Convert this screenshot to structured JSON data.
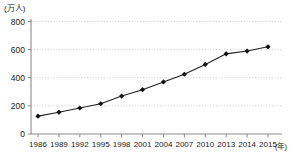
{
  "chart_data": {
    "type": "line",
    "title": "",
    "subtitle": "",
    "xlabel": "(年)",
    "ylabel": "(万人)",
    "ylim": [
      0,
      800
    ],
    "yticks": [
      0,
      200,
      400,
      600,
      800
    ],
    "grid": true,
    "grid_style": "dotted-horizontal",
    "legend": "none",
    "marker": "diamond",
    "line_color": "#222222",
    "marker_color": "#111111",
    "grid_color": "#c8c8c8",
    "axis_color": "#8a8a8a",
    "categories": [
      "1986",
      "1989",
      "1992",
      "1995",
      "1998",
      "2001",
      "2004",
      "2007",
      "2010",
      "2013",
      "2014",
      "2015"
    ],
    "values": [
      127,
      155,
      185,
      215,
      270,
      315,
      370,
      425,
      495,
      570,
      590,
      620
    ],
    "series": [
      {
        "name": "",
        "values": [
          127,
          155,
          185,
          215,
          270,
          315,
          370,
          425,
          495,
          570,
          590,
          620
        ]
      }
    ],
    "ytick_labels": [
      "800",
      "600",
      "400",
      "200",
      "0"
    ],
    "xtick_labels": [
      "1986",
      "1989",
      "1992",
      "1995",
      "1998",
      "2001",
      "2004",
      "2007",
      "2010",
      "2013",
      "2014",
      "2015"
    ]
  },
  "axis": {
    "y_unit_label": "(万人)",
    "x_unit_label": "(年)"
  }
}
